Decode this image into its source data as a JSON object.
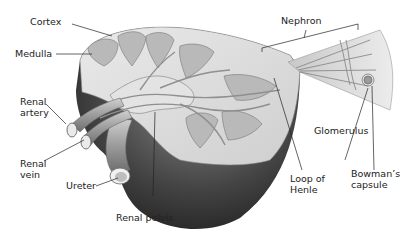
{
  "labels": {
    "cortex": "Cortex",
    "medulla": "Medulla",
    "renal_artery_1": "Renal",
    "renal_artery_2": "artery",
    "renal_vein_1": "Renal",
    "renal_vein_2": "vein",
    "ureter": "Ureter",
    "renal_pelvis": "Renal pelvis",
    "nephron": "Nephron",
    "glomerulus": "Glomerulus",
    "loop_of_henle_1": "Loop of",
    "loop_of_henle_2": "Henle",
    "bowmans_capsule_1": "Bowman’s",
    "bowmans_capsule_2": "capsule"
  },
  "colors": {
    "background": "#ffffff",
    "outer_dark": "#3a3a3a",
    "cut_surface": "#d9d9d9",
    "pyramid": "#bdbdbd",
    "vessel": "#9a9a9a",
    "leader_line": "#222222"
  }
}
